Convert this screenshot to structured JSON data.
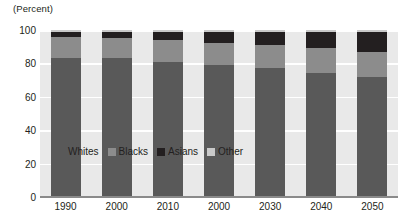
{
  "axis": {
    "unit_label": "(Percent)",
    "y_ticks": [
      "100",
      "80",
      "60",
      "40",
      "20",
      "0"
    ],
    "x_labels": [
      "1990",
      "2000",
      "2010",
      "2000",
      "2030",
      "2040",
      "2050"
    ]
  },
  "legend": {
    "items": [
      {
        "label": "Whites",
        "color": "#595959"
      },
      {
        "label": "Blacks",
        "color": "#8c8c8c"
      },
      {
        "label": "Asians",
        "color": "#231f20"
      },
      {
        "label": "Other",
        "color": "#c9c9c9"
      }
    ]
  },
  "colors": {
    "plot_background": "#e9e9e9",
    "gridline": "#ffffff",
    "axis": "#8a8a8a",
    "text": "#231f20"
  },
  "chart_data": {
    "type": "bar",
    "title": "",
    "subtitle": "",
    "xlabel": "",
    "ylabel": "(Percent)",
    "ylim": [
      0,
      100
    ],
    "yticks": [
      0,
      20,
      40,
      60,
      80,
      100
    ],
    "grid": true,
    "stacked": true,
    "stack_total": 100,
    "legend_position": "inside-lower-left",
    "categories": [
      "1990",
      "2000",
      "2010",
      "2000",
      "2030",
      "2040",
      "2050"
    ],
    "series": [
      {
        "name": "Whites",
        "color": "#595959",
        "values": [
          83,
          83,
          81,
          79,
          77,
          74,
          72
        ]
      },
      {
        "name": "Blacks",
        "color": "#8c8c8c",
        "values": [
          13,
          12,
          13,
          13,
          14,
          15,
          15
        ]
      },
      {
        "name": "Asians",
        "color": "#231f20",
        "values": [
          3,
          4,
          5,
          7,
          8,
          10,
          12
        ]
      },
      {
        "name": "Other",
        "color": "#c9c9c9",
        "values": [
          1,
          1,
          1,
          1,
          1,
          1,
          1
        ]
      }
    ]
  }
}
